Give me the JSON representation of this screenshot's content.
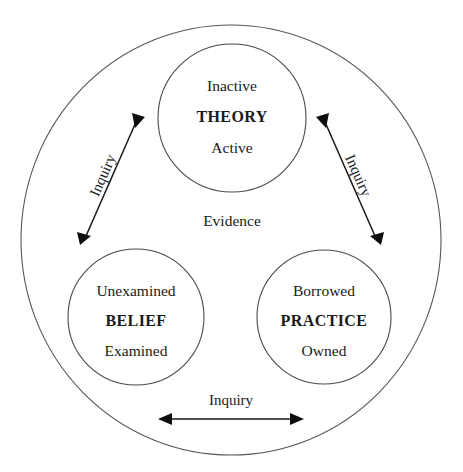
{
  "diagram": {
    "center_label": "Evidence",
    "outer_boundary_name": "evidence-boundary",
    "colors": {
      "background": "#ffffff",
      "outline": "#555555",
      "text": "#1a1a1a",
      "arrow": "#0d0d0d"
    },
    "nodes": [
      {
        "id": "theory",
        "main": "THEORY",
        "top": "Inactive",
        "bottom": "Active",
        "cx": 232,
        "cy": 118,
        "r": 74
      },
      {
        "id": "belief",
        "main": "BELIEF",
        "top": "Unexamined",
        "bottom": "Examined",
        "cx": 136,
        "cy": 317,
        "r": 68
      },
      {
        "id": "practice",
        "main": "PRACTICE",
        "top": "Borrowed",
        "bottom": "Owned",
        "cx": 324,
        "cy": 317,
        "r": 67
      }
    ],
    "edges": [
      {
        "id": "belief-theory",
        "label": "Inquiry",
        "from": "belief",
        "to": "theory",
        "bidirectional": true
      },
      {
        "id": "theory-practice",
        "label": "Inquiry",
        "from": "theory",
        "to": "practice",
        "bidirectional": true
      },
      {
        "id": "belief-practice",
        "label": "Inquiry",
        "from": "belief",
        "to": "practice",
        "bidirectional": true
      }
    ]
  }
}
